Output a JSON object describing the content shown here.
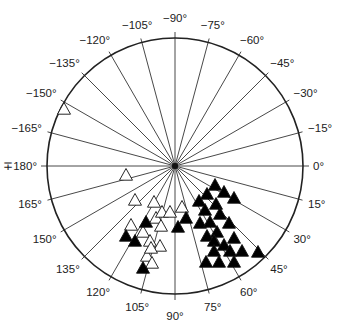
{
  "diagram": {
    "type": "polar-azimuth-plot",
    "center": [
      175,
      166
    ],
    "radius": 128,
    "colors": {
      "stroke": "#222222",
      "filled": "#000000",
      "open": "#ffffff"
    },
    "spokes_deg": [
      -165,
      -150,
      -135,
      -120,
      -105,
      -90,
      -75,
      -60,
      -45,
      -30,
      -15,
      0,
      15,
      30,
      45,
      60,
      75,
      90,
      105,
      120,
      135,
      150,
      165,
      180
    ],
    "labels": [
      {
        "angle": 0,
        "text": "0°"
      },
      {
        "angle": 15,
        "text": "15°"
      },
      {
        "angle": 30,
        "text": "30°"
      },
      {
        "angle": 45,
        "text": "45°"
      },
      {
        "angle": 60,
        "text": "60°"
      },
      {
        "angle": 75,
        "text": "75°"
      },
      {
        "angle": 90,
        "text": "90°"
      },
      {
        "angle": 105,
        "text": "105°"
      },
      {
        "angle": 120,
        "text": "120°"
      },
      {
        "angle": 135,
        "text": "135°"
      },
      {
        "angle": 150,
        "text": "150°"
      },
      {
        "angle": 165,
        "text": "165°"
      },
      {
        "angle": 180,
        "text": "∓180°"
      },
      {
        "angle": -165,
        "text": "−165°"
      },
      {
        "angle": -150,
        "text": "−150°"
      },
      {
        "angle": -135,
        "text": "−135°"
      },
      {
        "angle": -120,
        "text": "−120°"
      },
      {
        "angle": -105,
        "text": "−105°"
      },
      {
        "angle": -90,
        "text": "−90°"
      },
      {
        "angle": -75,
        "text": "−75°"
      },
      {
        "angle": -60,
        "text": "−60°"
      },
      {
        "angle": -45,
        "text": "−45°"
      },
      {
        "angle": -30,
        "text": "−30°"
      },
      {
        "angle": -15,
        "text": "−15°"
      }
    ],
    "open_triangles": [
      [
        64,
        109
      ],
      [
        126,
        175
      ],
      [
        135,
        200
      ],
      [
        154,
        202
      ],
      [
        131,
        225
      ],
      [
        143,
        232
      ],
      [
        156,
        218
      ],
      [
        161,
        226
      ],
      [
        150,
        241
      ],
      [
        160,
        246
      ],
      [
        147,
        256
      ],
      [
        152,
        263
      ],
      [
        151,
        248
      ],
      [
        162,
        212
      ],
      [
        182,
        207
      ],
      [
        170,
        212
      ]
    ],
    "filled_triangles": [
      [
        126,
        236
      ],
      [
        135,
        241
      ],
      [
        146,
        222
      ],
      [
        178,
        227
      ],
      [
        186,
        218
      ],
      [
        143,
        268
      ],
      [
        215,
        185
      ],
      [
        207,
        194
      ],
      [
        224,
        192
      ],
      [
        234,
        198
      ],
      [
        199,
        201
      ],
      [
        216,
        204
      ],
      [
        205,
        210
      ],
      [
        220,
        214
      ],
      [
        200,
        223
      ],
      [
        210,
        222
      ],
      [
        229,
        223
      ],
      [
        207,
        236
      ],
      [
        217,
        232
      ],
      [
        234,
        238
      ],
      [
        214,
        241
      ],
      [
        224,
        245
      ],
      [
        214,
        251
      ],
      [
        230,
        251
      ],
      [
        242,
        251
      ],
      [
        258,
        252
      ],
      [
        219,
        262
      ],
      [
        234,
        262
      ],
      [
        206,
        262
      ]
    ]
  }
}
